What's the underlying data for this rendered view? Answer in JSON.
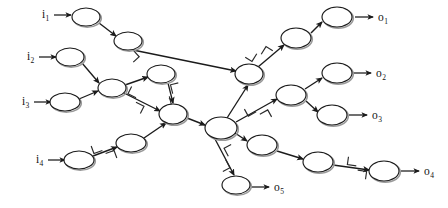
{
  "figure": {
    "title": "",
    "background_color": "#ffffff",
    "ink_color": "#1b1b1b",
    "node_fill": "#ffffff",
    "node_shadow_color": "#9a9a9a",
    "width": 448,
    "height": 208
  },
  "inputs": [
    {
      "id": "i1",
      "base": "i",
      "sub": "1",
      "label_x": 42,
      "label_y": 18,
      "arrow_from_x": 54,
      "arrow_to_x": 71,
      "arrow_y": 15
    },
    {
      "id": "i2",
      "base": "i",
      "sub": "2",
      "label_x": 27,
      "label_y": 60,
      "arrow_from_x": 39,
      "arrow_to_x": 56,
      "arrow_y": 57
    },
    {
      "id": "i3",
      "base": "i",
      "sub": "3",
      "label_x": 22,
      "label_y": 105,
      "arrow_from_x": 34,
      "arrow_to_x": 51,
      "arrow_y": 102
    },
    {
      "id": "i4",
      "base": "i",
      "sub": "4",
      "label_x": 36,
      "label_y": 163,
      "arrow_from_x": 48,
      "arrow_to_x": 65,
      "arrow_y": 160
    }
  ],
  "outputs": [
    {
      "id": "o1",
      "base": "o",
      "sub": "1",
      "label_x": 378,
      "label_y": 21,
      "arrow_from_x": 355,
      "arrow_to_x": 373,
      "arrow_y": 17
    },
    {
      "id": "o2",
      "base": "o",
      "sub": "2",
      "label_x": 376,
      "label_y": 77,
      "arrow_from_x": 353,
      "arrow_to_x": 371,
      "arrow_y": 73
    },
    {
      "id": "o3",
      "base": "o",
      "sub": "3",
      "label_x": 372,
      "label_y": 119,
      "arrow_from_x": 349,
      "arrow_to_x": 367,
      "arrow_y": 115
    },
    {
      "id": "o4",
      "base": "o",
      "sub": "4",
      "label_x": 424,
      "label_y": 175,
      "arrow_from_x": 401,
      "arrow_to_x": 419,
      "arrow_y": 171
    },
    {
      "id": "o5",
      "base": "o",
      "sub": "5",
      "label_x": 274,
      "label_y": 191,
      "arrow_from_x": 251,
      "arrow_to_x": 269,
      "arrow_y": 187
    }
  ],
  "nodes": [
    {
      "id": "n1",
      "cx": 86,
      "cy": 17,
      "rx": 14,
      "ry": 9
    },
    {
      "id": "n2",
      "cx": 128,
      "cy": 41,
      "rx": 14,
      "ry": 9
    },
    {
      "id": "n3",
      "cx": 70,
      "cy": 57,
      "rx": 14,
      "ry": 9
    },
    {
      "id": "n4",
      "cx": 112,
      "cy": 88,
      "rx": 14,
      "ry": 9
    },
    {
      "id": "n5",
      "cx": 65,
      "cy": 102,
      "rx": 15,
      "ry": 9
    },
    {
      "id": "n6",
      "cx": 161,
      "cy": 74,
      "rx": 14,
      "ry": 9
    },
    {
      "id": "n7",
      "cx": 79,
      "cy": 160,
      "rx": 15,
      "ry": 9
    },
    {
      "id": "n8",
      "cx": 131,
      "cy": 143,
      "rx": 15,
      "ry": 9
    },
    {
      "id": "hubL",
      "cx": 173,
      "cy": 114,
      "rx": 14,
      "ry": 10
    },
    {
      "id": "hubR",
      "cx": 221,
      "cy": 128,
      "rx": 16,
      "ry": 11
    },
    {
      "id": "n11",
      "cx": 249,
      "cy": 74,
      "rx": 14,
      "ry": 10
    },
    {
      "id": "n12",
      "cx": 296,
      "cy": 38,
      "rx": 15,
      "ry": 10
    },
    {
      "id": "n13",
      "cx": 337,
      "cy": 17,
      "rx": 15,
      "ry": 10
    },
    {
      "id": "n14",
      "cx": 291,
      "cy": 95,
      "rx": 15,
      "ry": 10
    },
    {
      "id": "n15",
      "cx": 337,
      "cy": 73,
      "rx": 15,
      "ry": 10
    },
    {
      "id": "n16",
      "cx": 332,
      "cy": 115,
      "rx": 15,
      "ry": 10
    },
    {
      "id": "n17",
      "cx": 262,
      "cy": 145,
      "rx": 15,
      "ry": 10
    },
    {
      "id": "n18",
      "cx": 318,
      "cy": 162,
      "rx": 15,
      "ry": 10
    },
    {
      "id": "n19",
      "cx": 384,
      "cy": 171,
      "rx": 15,
      "ry": 10
    },
    {
      "id": "n20",
      "cx": 236,
      "cy": 185,
      "rx": 14,
      "ry": 9
    }
  ],
  "edges": [
    {
      "id": "e1",
      "from": "n1",
      "to": "n2",
      "x1": 99,
      "y1": 23,
      "x2": 116,
      "y2": 36
    },
    {
      "id": "e2",
      "from": "n2",
      "to": "n11",
      "x1": 133,
      "y1": 50,
      "x2": 236,
      "y2": 71
    },
    {
      "id": "e3",
      "from": "n3",
      "to": "n4",
      "x1": 82,
      "y1": 63,
      "x2": 99,
      "y2": 83
    },
    {
      "id": "e4",
      "from": "n5",
      "to": "n4",
      "x1": 79,
      "y1": 99,
      "x2": 98,
      "y2": 91
    },
    {
      "id": "e5",
      "from": "n4",
      "to": "n6",
      "x1": 125,
      "y1": 85,
      "x2": 148,
      "y2": 77
    },
    {
      "id": "e6",
      "from": "n4",
      "to": "hubL",
      "x1": 124,
      "y1": 93,
      "x2": 160,
      "y2": 111
    },
    {
      "id": "e7",
      "from": "n6",
      "to": "hubL",
      "x1": 168,
      "y1": 83,
      "x2": 173,
      "y2": 103
    },
    {
      "id": "e8",
      "from": "n7",
      "to": "n8",
      "x1": 93,
      "y1": 156,
      "x2": 117,
      "y2": 147
    },
    {
      "id": "e9",
      "from": "n8",
      "to": "hubL",
      "x1": 144,
      "y1": 138,
      "x2": 166,
      "y2": 123
    },
    {
      "id": "e10",
      "from": "hubL",
      "to": "hubR",
      "x1": 187,
      "y1": 118,
      "x2": 205,
      "y2": 125
    },
    {
      "id": "e11",
      "from": "hubR",
      "to": "n11",
      "x1": 227,
      "y1": 118,
      "x2": 248,
      "y2": 85
    },
    {
      "id": "e12",
      "from": "n11",
      "to": "n12",
      "x1": 258,
      "y1": 67,
      "x2": 284,
      "y2": 45
    },
    {
      "id": "e13",
      "from": "n12",
      "to": "n13",
      "x1": 311,
      "y1": 33,
      "x2": 322,
      "y2": 22
    },
    {
      "id": "e14",
      "from": "hubR",
      "to": "n14",
      "x1": 236,
      "y1": 122,
      "x2": 277,
      "y2": 99
    },
    {
      "id": "e15",
      "from": "n14",
      "to": "n15",
      "x1": 305,
      "y1": 89,
      "x2": 322,
      "y2": 78
    },
    {
      "id": "e16",
      "from": "n14",
      "to": "n16",
      "x1": 306,
      "y1": 101,
      "x2": 318,
      "y2": 112
    },
    {
      "id": "e17",
      "from": "hubR",
      "to": "n17",
      "x1": 235,
      "y1": 133,
      "x2": 247,
      "y2": 141
    },
    {
      "id": "e18",
      "from": "n17",
      "to": "n18",
      "x1": 277,
      "y1": 151,
      "x2": 303,
      "y2": 159
    },
    {
      "id": "e19",
      "from": "n18",
      "to": "n19",
      "x1": 333,
      "y1": 165,
      "x2": 369,
      "y2": 170
    },
    {
      "id": "e20",
      "from": "hubR",
      "to": "n20",
      "x1": 215,
      "y1": 139,
      "x2": 234,
      "y2": 175
    }
  ],
  "cut_markers": [
    {
      "id": "c1",
      "on_edge": "e1",
      "x": 134,
      "y": 48,
      "angle": 48
    },
    {
      "id": "c2",
      "on_edge": "e6",
      "x": 136,
      "y": 100,
      "angle": 27
    },
    {
      "id": "c3",
      "on_edge": "e7",
      "x": 171,
      "y": 95,
      "angle": 76
    },
    {
      "id": "c4",
      "on_edge": "e8",
      "x": 104,
      "y": 152,
      "angle": -20
    },
    {
      "id": "c5",
      "on_edge": "e11",
      "x": 259,
      "y": 54,
      "angle": -58
    },
    {
      "id": "c6",
      "on_edge": "e14",
      "x": 258,
      "y": 113,
      "angle": -29
    },
    {
      "id": "c7",
      "on_edge": "e20",
      "x": 227,
      "y": 158,
      "angle": 62
    },
    {
      "id": "c8",
      "on_edge": "e19",
      "x": 357,
      "y": 168,
      "angle": 8
    }
  ],
  "legend": {
    "node_meaning": "processing unit",
    "cut_marker_meaning": "edge marker"
  }
}
